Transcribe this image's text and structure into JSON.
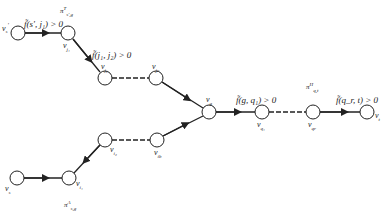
{
  "diagram": {
    "nodes": [
      {
        "id": "v_s_prime",
        "label": "v_s'",
        "x": 18,
        "y": 33
      },
      {
        "id": "v_j1",
        "label": "v_j1",
        "x": 68,
        "y": 33
      },
      {
        "id": "v_j2",
        "label": "v_j2",
        "x": 105,
        "y": 78
      },
      {
        "id": "v_jc",
        "label": "v_jc",
        "x": 156,
        "y": 78
      },
      {
        "id": "v_g",
        "label": "v_g",
        "x": 209,
        "y": 112
      },
      {
        "id": "v_q1",
        "label": "v_q1",
        "x": 262,
        "y": 112
      },
      {
        "id": "v_qr",
        "label": "v_qr",
        "x": 313,
        "y": 112
      },
      {
        "id": "v_t",
        "label": "v_t",
        "x": 367,
        "y": 112
      },
      {
        "id": "v_i2",
        "label": "v_i2",
        "x": 105,
        "y": 140
      },
      {
        "id": "v_ib",
        "label": "v_ib",
        "x": 157,
        "y": 140
      },
      {
        "id": "v_s",
        "label": "v_s",
        "x": 17,
        "y": 178
      },
      {
        "id": "v_i1",
        "label": "v_i1",
        "x": 69,
        "y": 178
      }
    ],
    "edge_labels": {
      "s_prime_j1": "f̃(s', j₁) > 0",
      "j1_j2": "f̃(j₁, j₂) > 0",
      "g_q1": "f̃(g, q₁) > 0",
      "qr_t": "f̃(q_r, t) > 0"
    },
    "path_labels": {
      "upper": "π^T_{s',g}",
      "lower": "π^A_{s,g}",
      "right": "π^H_{q,t}"
    },
    "node_text": {
      "v_s_prime": "v",
      "v_s_prime_sub": "s",
      "v_s_prime_sup": "'",
      "v_j1": "v",
      "v_j1_sub": "j₁",
      "v_j2": "v",
      "v_j2_sub": "j₂",
      "v_jc": "v",
      "v_jc_sub": "jc",
      "v_g": "v",
      "v_g_sub": "g",
      "v_q1": "v",
      "v_q1_sub": "q₁",
      "v_qr": "v",
      "v_qr_sub": "qr",
      "v_t": "v",
      "v_t_sub": "t",
      "v_i2": "v",
      "v_i2_sub": "i₂",
      "v_ib": "v",
      "v_ib_sub": "ib",
      "v_s": "v",
      "v_s_sub": "s",
      "v_i1": "v",
      "v_i1_sub": "i₁"
    },
    "path_text": {
      "upper_base": "π",
      "upper_sup": "T",
      "upper_sub": "s',g",
      "lower_base": "π",
      "lower_sup": "A",
      "lower_sub": "s,g",
      "right_base": "π",
      "right_sup": "H",
      "right_sub": "q,t"
    },
    "colors": {
      "stroke": "#222222",
      "node_fill": "#ffffff"
    }
  }
}
